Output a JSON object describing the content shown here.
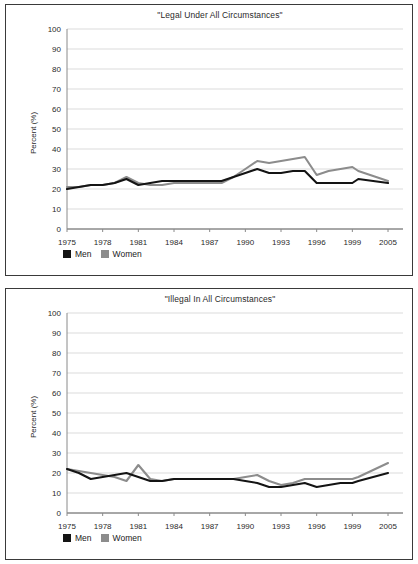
{
  "figure": {
    "panels": [
      {
        "id": "legal-panel",
        "title": "\"Legal Under All Circumstances\"",
        "ylabel": "Percent (%)",
        "legend": [
          {
            "label": "Men",
            "color": "#141414"
          },
          {
            "label": "Women",
            "color": "#8c8c8c"
          }
        ]
      },
      {
        "id": "illegal-panel",
        "title": "\"Illegal In All Circumstances\"",
        "ylabel": "Percent (%)",
        "legend": [
          {
            "label": "Men",
            "color": "#141414"
          },
          {
            "label": "Women",
            "color": "#8c8c8c"
          }
        ]
      }
    ]
  },
  "chart_data": [
    {
      "type": "line",
      "title": "\"Legal Under All Circumstances\"",
      "xlabel": "",
      "ylabel": "Percent (%)",
      "ylim": [
        0,
        100
      ],
      "yticks": [
        0,
        10,
        20,
        30,
        40,
        50,
        60,
        70,
        80,
        90,
        100
      ],
      "grid": true,
      "legend_position": "below-left",
      "xticklabels": [
        "1975",
        "1978",
        "1981",
        "1984",
        "1987",
        "1990",
        "1993",
        "1996",
        "1999",
        "2005"
      ],
      "x": [
        1975,
        1976,
        1977,
        1978,
        1979,
        1980,
        1981,
        1982,
        1983,
        1984,
        1985,
        1986,
        1987,
        1988,
        1989,
        1990,
        1991,
        1992,
        1993,
        1994,
        1995,
        1996,
        1997,
        1998,
        1999,
        2000,
        2005
      ],
      "series": [
        {
          "name": "Men",
          "color": "#141414",
          "values": [
            20,
            21,
            22,
            22,
            23,
            25,
            22,
            23,
            24,
            24,
            24,
            24,
            24,
            24,
            26,
            28,
            30,
            28,
            28,
            29,
            29,
            23,
            23,
            23,
            23,
            25,
            23
          ]
        },
        {
          "name": "Women",
          "color": "#8c8c8c",
          "values": [
            21,
            21,
            22,
            22,
            23,
            26,
            23,
            22,
            22,
            23,
            23,
            23,
            23,
            23,
            26,
            30,
            34,
            33,
            34,
            35,
            36,
            27,
            29,
            30,
            31,
            29,
            24
          ]
        }
      ]
    },
    {
      "type": "line",
      "title": "\"Illegal In All Circumstances\"",
      "xlabel": "",
      "ylabel": "Percent (%)",
      "ylim": [
        0,
        100
      ],
      "yticks": [
        0,
        10,
        20,
        30,
        40,
        50,
        60,
        70,
        80,
        90,
        100
      ],
      "grid": true,
      "legend_position": "below-left",
      "xticklabels": [
        "1975",
        "1978",
        "1981",
        "1984",
        "1987",
        "1990",
        "1993",
        "1996",
        "1999",
        "2005"
      ],
      "x": [
        1975,
        1976,
        1977,
        1978,
        1979,
        1980,
        1981,
        1982,
        1983,
        1984,
        1985,
        1986,
        1987,
        1988,
        1989,
        1990,
        1991,
        1992,
        1993,
        1994,
        1995,
        1996,
        1997,
        1998,
        1999,
        2000,
        2005
      ],
      "series": [
        {
          "name": "Men",
          "color": "#141414",
          "values": [
            22,
            20,
            17,
            18,
            19,
            20,
            18,
            16,
            16,
            17,
            17,
            17,
            17,
            17,
            17,
            16,
            15,
            13,
            13,
            14,
            15,
            13,
            14,
            15,
            15,
            16,
            20
          ]
        },
        {
          "name": "Women",
          "color": "#8c8c8c",
          "values": [
            22,
            21,
            20,
            19,
            18,
            16,
            24,
            17,
            16,
            17,
            17,
            17,
            17,
            17,
            17,
            18,
            19,
            16,
            14,
            15,
            17,
            17,
            17,
            17,
            17,
            18,
            25
          ]
        }
      ]
    }
  ]
}
